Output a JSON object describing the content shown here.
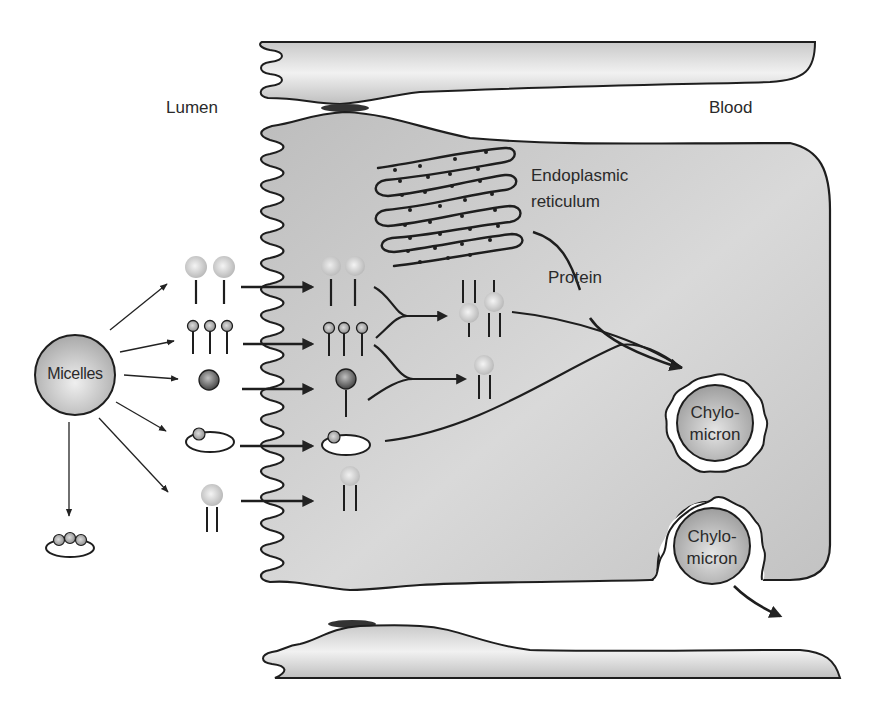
{
  "diagram": {
    "regions": {
      "lumen": "Lumen",
      "blood": "Blood"
    },
    "organelles": {
      "er_line1": "Endoplasmic",
      "er_line2": "reticulum",
      "protein": "Protein"
    },
    "micelles": {
      "label": "Micelles"
    },
    "chylomicrons": [
      {
        "line1": "Chylo-",
        "line2": "micron"
      },
      {
        "line1": "Chylo-",
        "line2": "micron"
      }
    ],
    "molecule_types": [
      "fatty-acid-with-large-head",
      "monoglyceride-small-head",
      "cholesterol",
      "cholesterol-ester-ring",
      "phospholipid-double-tail",
      "bile-salt-ring"
    ],
    "colors": {
      "cell_fill": "#c8c8c8",
      "cell_light": "#e6e6e6",
      "outline": "#1e1e1e",
      "junction": "#333333",
      "background": "#ffffff"
    }
  }
}
